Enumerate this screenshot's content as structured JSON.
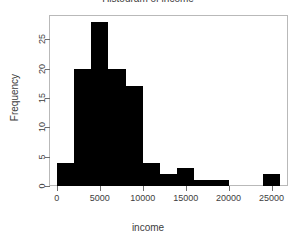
{
  "chart_data": {
    "type": "bar",
    "title": "Histogram of income",
    "xlabel": "income",
    "ylabel": "Frequency",
    "categories": [
      "0-2000",
      "2000-4000",
      "4000-6000",
      "6000-8000",
      "8000-10000",
      "10000-12000",
      "12000-14000",
      "14000-16000",
      "16000-18000",
      "18000-20000",
      "20000-22000",
      "22000-24000",
      "24000-26000"
    ],
    "bin_edges": [
      0,
      2000,
      4000,
      6000,
      8000,
      10000,
      12000,
      14000,
      16000,
      18000,
      20000,
      22000,
      24000,
      26000
    ],
    "values": [
      4,
      20,
      28,
      20,
      17,
      4,
      2,
      3,
      1,
      1,
      0,
      0,
      2
    ],
    "bin_width": 2000,
    "xlim": [
      -800,
      26800
    ],
    "ylim": [
      0,
      29
    ],
    "xticks": [
      0,
      5000,
      10000,
      15000,
      20000,
      25000
    ],
    "xtick_labels": [
      "0",
      "5000",
      "10000",
      "15000",
      "20000",
      "25000"
    ],
    "yticks": [
      0,
      5,
      10,
      15,
      20,
      25
    ],
    "ytick_labels": [
      "0",
      "5",
      "10",
      "15",
      "20",
      "25"
    ],
    "grid": false,
    "legend": false,
    "bar_color": "#000000",
    "frame_color": "#b9b9b9",
    "background": "#ffffff"
  }
}
